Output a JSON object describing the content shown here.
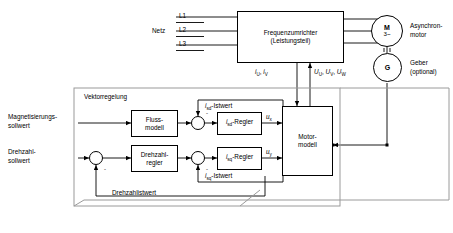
{
  "diagram": {
    "title": "Vektorregelung",
    "mains": {
      "label": "Netz",
      "phases": [
        "L1",
        "L2",
        "L3"
      ]
    },
    "converter": {
      "line1": "Frequenzumrichter",
      "line2": "(Leistungsteil)"
    },
    "motor": {
      "symbol": "M",
      "phase_mark": "3~",
      "label_line1": "Asynchron-",
      "label_line2": "motor"
    },
    "encoder": {
      "symbol": "G",
      "label_line1": "Geber",
      "label_line2": "(optional)"
    },
    "measurement": {
      "currents": "iᵤ, iᵥ",
      "voltages": "Uᵤ, Uᵥ, Uᴡ",
      "currents_parts": {
        "i1": "i",
        "s1": "U",
        "i2": "i",
        "s2": "V"
      },
      "voltage_parts": {
        "u1": "U",
        "s1": "U",
        "u2": "U",
        "s2": "V",
        "u3": "U",
        "s3": "W"
      }
    },
    "setpoints": {
      "flux_line1": "Magnetisierungs-",
      "flux_line2": "sollwert",
      "speed_line1": "Drehzahl-",
      "speed_line2": "sollwert"
    },
    "blocks": {
      "flux_model_line1": "Fluss-",
      "flux_model_line2": "modell",
      "speed_ctrl_line1": "Drehzahl-",
      "speed_ctrl_line2": "regler",
      "isd_regulator": "-Regler",
      "isq_regulator": "-Regler",
      "motor_model_line1": "Motor-",
      "motor_model_line2": "modell"
    },
    "signals": {
      "isd_actual": "-Istwert",
      "isq_actual": "-Istwert",
      "ux": "u",
      "ux_sub": "x",
      "uy": "u",
      "uy_sub": "y",
      "speed_actual": "Drehzahlistwert",
      "i_sym": "i",
      "isd_sub": "sd",
      "isq_sub": "sq",
      "minus": "-"
    },
    "colors": {
      "line": "#000000",
      "boundary": "#9a9a9a",
      "background": "#ffffff"
    }
  }
}
